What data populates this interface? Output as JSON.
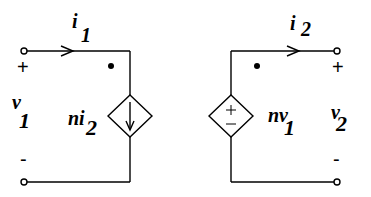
{
  "diagram": {
    "type": "two-port ideal transformer equivalent circuit",
    "port1": {
      "current_label": "i",
      "current_subscript": "1",
      "voltage_label": "v",
      "voltage_subscript": "1",
      "plus": "+",
      "minus": "-"
    },
    "port2": {
      "current_label": "i",
      "current_subscript": "2",
      "voltage_label": "v",
      "voltage_subscript": "2",
      "plus": "+",
      "minus": "-"
    },
    "dependent_current_source": {
      "label": "ni",
      "subscript": "2",
      "direction": "down"
    },
    "dependent_voltage_source": {
      "label": "nv",
      "subscript": "1",
      "plus": "+",
      "minus": "−"
    },
    "colors": {
      "line": "#000000",
      "background": "#ffffff"
    }
  }
}
